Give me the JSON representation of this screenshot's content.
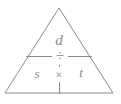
{
  "figure": {
    "kind": "formula-triangle",
    "stroke_color": "#8a8a8a",
    "text_color": "#8a8a8a",
    "background_color": "#ffffff"
  },
  "labels": {
    "top": "d",
    "bottom_left": "s",
    "bottom_right": "t"
  },
  "operators": {
    "divide": "÷",
    "multiply": "×"
  },
  "geometry": {
    "apex": [
      59,
      8
    ],
    "base_left": [
      5,
      93
    ],
    "base_right": [
      113,
      93
    ],
    "divider_left": [
      26,
      56
    ],
    "divider_right": [
      92,
      56
    ],
    "vertical_top": [
      59,
      56
    ],
    "vertical_bottom": [
      59,
      94
    ]
  }
}
